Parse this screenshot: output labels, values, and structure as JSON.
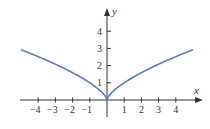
{
  "chart_data": {
    "type": "line",
    "title": "",
    "function": "y = x^(2/3)",
    "xlabel": "x",
    "ylabel": "y",
    "xlim": [
      -5,
      5
    ],
    "ylim": [
      0,
      4.8
    ],
    "x_ticks": [
      -4,
      -3,
      -2,
      -1,
      1,
      2,
      3,
      4
    ],
    "x_tick_labels": [
      "−4",
      "−3",
      "−2",
      "−1",
      "1",
      "2",
      "3",
      "4"
    ],
    "y_ticks": [
      1,
      2,
      3,
      4
    ],
    "y_tick_labels": [
      "1",
      "2",
      "3",
      "4"
    ],
    "grid": false,
    "legend": null,
    "series": [
      {
        "name": "y = x^(2/3)",
        "color": "#5b78c4",
        "x": [
          -5,
          -4,
          -3,
          -2,
          -1,
          -0.5,
          0,
          0.5,
          1,
          2,
          3,
          4,
          5
        ],
        "y": [
          2.92,
          2.52,
          2.08,
          1.59,
          1.0,
          0.63,
          0,
          0.63,
          1.0,
          1.59,
          2.08,
          2.52,
          2.92
        ]
      }
    ]
  },
  "colors": {
    "curve": "#5b78c4",
    "axis": "#333333",
    "background": "#ffffff"
  }
}
